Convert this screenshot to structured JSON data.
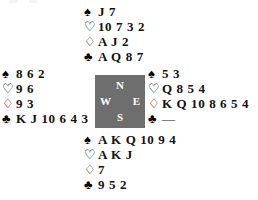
{
  "diagram": {
    "suit_symbols": {
      "spade": "♠",
      "heart": "♡",
      "diamond": "♢",
      "club": "♣"
    },
    "void_marker": "—",
    "compass": {
      "north": "N",
      "west": "W",
      "east": "E",
      "south": "S",
      "box_color": "#6e6e6e",
      "letter_color": "#ffffff"
    },
    "hands": {
      "north": {
        "label": "North",
        "spades": "J 7",
        "hearts": "10 7 3 2",
        "diamonds": "A J 2",
        "clubs": "A Q 8 7"
      },
      "west": {
        "label": "West",
        "spades": "8 6 2",
        "hearts": "9 6",
        "diamonds": "9 3",
        "clubs": "K J 10 6 4 3"
      },
      "east": {
        "label": "East",
        "spades": "5 3",
        "hearts": "Q 8 5 4",
        "diamonds": "K Q 10 8 6 5 4",
        "clubs": "—"
      },
      "south": {
        "label": "South",
        "spades": "A K Q 10 9 4",
        "hearts": "A K J",
        "diamonds": "7",
        "clubs": "9 5 2"
      }
    }
  }
}
